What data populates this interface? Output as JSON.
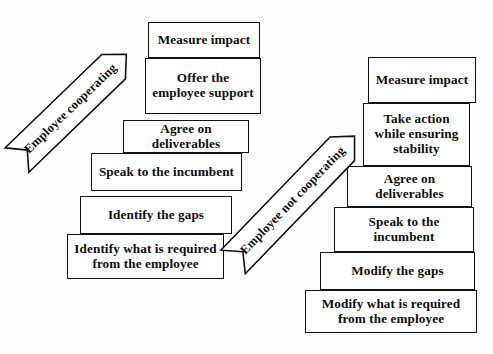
{
  "diagram": {
    "background_color": "#fefefe",
    "box_border_color": "#111111",
    "text_color": "#0d0d0d",
    "left_stack": {
      "arrow": {
        "label": "Employee cooperating",
        "direction": "up-right",
        "x": 17,
        "y": 160,
        "length": 152,
        "thickness": 34,
        "angle": -44,
        "font_size": 12.5
      },
      "steps": [
        {
          "text": "Identify what is required from the employee",
          "x": 67,
          "y": 234,
          "w": 157,
          "h": 45,
          "font_size": 13.2
        },
        {
          "text": "Identify the gaps",
          "x": 80,
          "y": 196,
          "w": 152,
          "h": 38,
          "font_size": 13.2
        },
        {
          "text": "Speak to the incumbent",
          "x": 91,
          "y": 153,
          "w": 151,
          "h": 38,
          "font_size": 13.2
        },
        {
          "text": "Agree on deliverables",
          "x": 123,
          "y": 120,
          "w": 126,
          "h": 33,
          "font_size": 13.2
        },
        {
          "text": "Offer the employee support",
          "x": 145,
          "y": 58,
          "w": 116,
          "h": 56,
          "font_size": 13.2
        },
        {
          "text": "Measure impact",
          "x": 148,
          "y": 22,
          "w": 112,
          "h": 36,
          "font_size": 13.2
        }
      ]
    },
    "right_stack": {
      "arrow": {
        "label": "Employee not cooperating",
        "direction": "up-right",
        "x": 233,
        "y": 262,
        "length": 175,
        "thickness": 34,
        "angle": -46,
        "font_size": 12.5
      },
      "steps": [
        {
          "text": "Modify what is required from the employee",
          "x": 305,
          "y": 290,
          "w": 172,
          "h": 43,
          "font_size": 13.2
        },
        {
          "text": "Modify the gaps",
          "x": 320,
          "y": 252,
          "w": 155,
          "h": 38,
          "font_size": 13.2
        },
        {
          "text": "Speak to the incumbent",
          "x": 334,
          "y": 207,
          "w": 140,
          "h": 45,
          "font_size": 13.2
        },
        {
          "text": "Agree on deliverables",
          "x": 347,
          "y": 166,
          "w": 125,
          "h": 41,
          "font_size": 13.2
        },
        {
          "text": "Take action while ensuring stability",
          "x": 363,
          "y": 103,
          "w": 107,
          "h": 63,
          "font_size": 13.2
        },
        {
          "text": "Measure impact",
          "x": 368,
          "y": 57,
          "w": 108,
          "h": 46,
          "font_size": 13.2
        }
      ]
    }
  }
}
